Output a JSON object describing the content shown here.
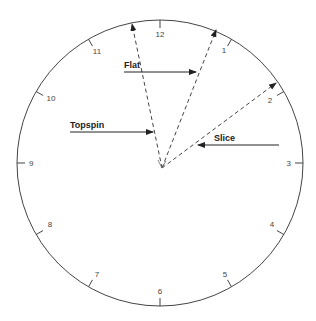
{
  "diagram": {
    "type": "clock-face racquet angle diagram",
    "clock_numbers": [
      "12",
      "1",
      "2",
      "3",
      "4",
      "5",
      "6",
      "7",
      "8",
      "9",
      "10",
      "11"
    ],
    "labels": {
      "flat": "Flat",
      "topspin": "Topspin",
      "slice": "Slice"
    },
    "dashed_paths": [
      {
        "name": "topspin-path",
        "points_to": "between 11 and 12"
      },
      {
        "name": "flat-path",
        "points_to": "near 1"
      },
      {
        "name": "slice-path",
        "points_to": "near 2"
      }
    ],
    "colors": {
      "line": "#333333",
      "text": "#222222",
      "background": "#ffffff"
    }
  }
}
